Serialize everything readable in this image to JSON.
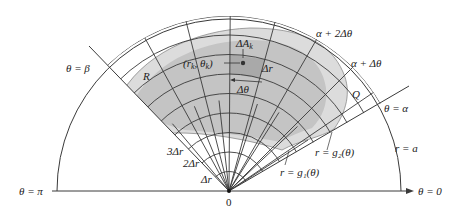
{
  "diagram": {
    "colors": {
      "line": "#3a3a3a",
      "region_light": "#dcdcdc",
      "region_mid": "#c4c4c4",
      "cell_highlight": "#a9a9a9",
      "background": "#ffffff"
    },
    "origin": {
      "label": "0"
    },
    "axis_labels": {
      "theta_zero": "θ = 0",
      "theta_pi": "θ = π",
      "theta_alpha": "θ = α",
      "theta_beta": "θ = β",
      "r_a": "r = a"
    },
    "angle_labels": {
      "alpha_plus_dtheta": "α + Δθ",
      "alpha_plus_2dtheta": "α + 2Δθ"
    },
    "radius_labels": {
      "dr": "Δr",
      "two_dr": "2Δr",
      "three_dr": "3Δr"
    },
    "curve_labels": {
      "g1": "r = g₁(θ)",
      "g2": "r = g₂(θ)"
    },
    "region_labels": {
      "R": "R",
      "Q": "Q"
    },
    "cell_labels": {
      "delta_A": "ΔA",
      "delta_A_sub": "k",
      "point": "(r",
      "point_sub1": "k",
      "point_mid": ", θ",
      "point_sub2": "k",
      "point_end": ")",
      "cell_dr": "Δr",
      "cell_dtheta": "Δθ"
    }
  }
}
